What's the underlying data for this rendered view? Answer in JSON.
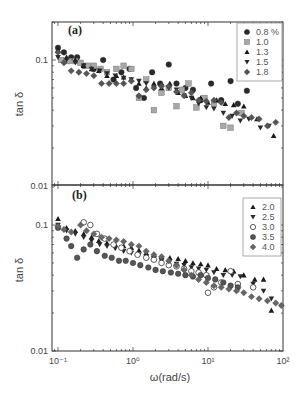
{
  "chart_data": [
    {
      "type": "scatter",
      "panel": "(a)",
      "xscale": "log",
      "yscale": "log",
      "xlabel": "",
      "ylabel": "tan δ",
      "xlim": [
        0.083,
        100
      ],
      "ylim": [
        0.01,
        0.2
      ],
      "yticks": [
        "0.1",
        "0.01"
      ],
      "legend_position": "upper right",
      "series": [
        {
          "name": "0.8 %",
          "marker": "circle",
          "color": "#2a2a2a",
          "x": [
            0.1,
            0.12,
            0.15,
            0.18,
            0.22,
            0.3,
            0.4,
            0.55,
            0.7,
            0.9,
            1.1,
            1.4,
            1.8,
            2.3,
            3,
            3.8,
            5,
            6.3,
            8,
            11,
            15,
            20,
            25,
            33
          ],
          "y": [
            0.125,
            0.115,
            0.105,
            0.105,
            0.09,
            0.085,
            0.1,
            0.07,
            0.08,
            0.085,
            0.06,
            0.05,
            0.08,
            0.065,
            0.092,
            0.065,
            0.06,
            0.058,
            0.048,
            0.065,
            0.048,
            0.068,
            0.045,
            0.057
          ]
        },
        {
          "name": "1.0",
          "marker": "square",
          "color": "#a8a8a8",
          "x": [
            0.11,
            0.14,
            0.17,
            0.2,
            0.25,
            0.3,
            0.37,
            0.45,
            0.6,
            0.75,
            0.95,
            1.2,
            1.5,
            1.9,
            2.4,
            3,
            3.8,
            4.5,
            5.5,
            7,
            9,
            12,
            16,
            20,
            28
          ],
          "y": [
            0.1,
            0.098,
            0.098,
            0.095,
            0.09,
            0.09,
            0.085,
            0.08,
            0.085,
            0.09,
            0.085,
            0.05,
            0.07,
            0.04,
            0.055,
            0.06,
            0.043,
            0.058,
            0.065,
            0.042,
            0.05,
            0.045,
            0.03,
            0.029,
            0.038
          ]
        },
        {
          "name": "1.3",
          "marker": "triangle-up",
          "color": "#1a1a1a",
          "x": [
            0.1,
            0.13,
            0.17,
            0.22,
            0.28,
            0.35,
            0.45,
            0.6,
            0.75,
            0.95,
            1.2,
            1.5,
            1.9,
            2.4,
            3.1,
            4,
            5,
            6.3,
            8,
            10,
            13,
            17,
            22,
            30,
            45,
            75
          ],
          "y": [
            0.12,
            0.105,
            0.1,
            0.09,
            0.085,
            0.082,
            0.075,
            0.075,
            0.073,
            0.07,
            0.065,
            0.06,
            0.065,
            0.06,
            0.065,
            0.055,
            0.052,
            0.05,
            0.05,
            0.046,
            0.048,
            0.045,
            0.044,
            0.043,
            0.034,
            0.025
          ]
        },
        {
          "name": "1.5",
          "marker": "triangle-down",
          "color": "#2a2a2a",
          "x": [
            0.1,
            0.13,
            0.17,
            0.22,
            0.28,
            0.36,
            0.45,
            0.58,
            0.75,
            0.95,
            1.2,
            1.5,
            1.9,
            2.4,
            3,
            3.8,
            4.8,
            6,
            7.5,
            9.5,
            12,
            16,
            21,
            27,
            35,
            50,
            65
          ],
          "y": [
            0.105,
            0.1,
            0.095,
            0.09,
            0.085,
            0.082,
            0.078,
            0.075,
            0.072,
            0.07,
            0.068,
            0.065,
            0.06,
            0.062,
            0.06,
            0.058,
            0.052,
            0.05,
            0.045,
            0.042,
            0.041,
            0.038,
            0.036,
            0.033,
            0.034,
            0.029,
            0.03
          ]
        },
        {
          "name": "1.8",
          "marker": "diamond",
          "color": "#555555",
          "x": [
            0.1,
            0.12,
            0.15,
            0.19,
            0.24,
            0.3,
            0.38,
            0.48,
            0.6,
            0.75,
            0.95,
            1.2,
            1.5,
            1.9,
            2.4,
            3,
            3.8,
            4.8,
            6,
            7.5,
            9.5,
            12,
            15,
            19,
            24,
            30,
            38,
            48,
            62,
            80
          ],
          "y": [
            0.115,
            0.095,
            0.082,
            0.08,
            0.078,
            0.075,
            0.065,
            0.065,
            0.065,
            0.065,
            0.068,
            0.052,
            0.058,
            0.06,
            0.062,
            0.062,
            0.056,
            0.052,
            0.055,
            0.048,
            0.047,
            0.048,
            0.046,
            0.035,
            0.038,
            0.036,
            0.035,
            0.034,
            0.03,
            0.032
          ]
        }
      ]
    },
    {
      "type": "scatter",
      "panel": "(b)",
      "xscale": "log",
      "yscale": "log",
      "xlabel": "ω(rad/s)",
      "ylabel": "tan δ",
      "xlim": [
        0.083,
        100
      ],
      "ylim": [
        0.01,
        0.2
      ],
      "xticks": [
        "10⁻¹",
        "10⁰",
        "10¹",
        "10²"
      ],
      "yticks": [
        "0.1",
        "0.01"
      ],
      "legend_position": "upper right",
      "series": [
        {
          "name": "2.0",
          "marker": "triangle-up",
          "color": "#1a1a1a",
          "x": [
            0.1,
            0.13,
            0.17,
            0.22,
            0.28,
            0.35,
            0.45,
            0.58,
            0.75,
            0.95,
            1.2,
            1.5,
            1.9,
            2.4,
            3.1,
            4,
            5,
            6.3,
            8,
            10,
            13,
            17,
            22,
            30,
            42,
            55,
            70
          ],
          "y": [
            0.112,
            0.095,
            0.09,
            0.085,
            0.08,
            0.075,
            0.072,
            0.07,
            0.068,
            0.066,
            0.063,
            0.06,
            0.058,
            0.056,
            0.055,
            0.054,
            0.052,
            0.05,
            0.049,
            0.048,
            0.045,
            0.044,
            0.043,
            0.04,
            0.037,
            0.037,
            0.021
          ]
        },
        {
          "name": "2.5",
          "marker": "triangle-down",
          "color": "#2a2a2a",
          "x": [
            0.1,
            0.13,
            0.17,
            0.22,
            0.28,
            0.36,
            0.45,
            0.58,
            0.75,
            0.95,
            1.2,
            1.5,
            1.9,
            2.4,
            3,
            3.8,
            4.8,
            6,
            7.5,
            9.5,
            12,
            16,
            21,
            27,
            40,
            55,
            70
          ],
          "y": [
            0.1,
            0.09,
            0.085,
            0.08,
            0.075,
            0.07,
            0.068,
            0.065,
            0.062,
            0.06,
            0.058,
            0.056,
            0.054,
            0.052,
            0.05,
            0.049,
            0.048,
            0.046,
            0.045,
            0.044,
            0.042,
            0.04,
            0.04,
            0.039,
            0.034,
            0.03,
            0.026
          ]
        },
        {
          "name": "3.0",
          "marker": "circle-open",
          "color": "#333333",
          "x": [
            0.22,
            0.27,
            0.33,
            0.42,
            0.55,
            0.7,
            0.9,
            1.15,
            1.5,
            1.9,
            2.4,
            3,
            3.8,
            4.8,
            6,
            7.5,
            9.5,
            10,
            12,
            15,
            20,
            25,
            40
          ],
          "y": [
            0.105,
            0.1,
            0.085,
            0.078,
            0.07,
            0.066,
            0.062,
            0.058,
            0.055,
            0.053,
            0.05,
            0.048,
            0.047,
            0.045,
            0.043,
            0.042,
            0.04,
            0.029,
            0.032,
            0.035,
            0.043,
            0.034,
            0.032
          ]
        },
        {
          "name": "3.5",
          "marker": "circle",
          "color": "#555555",
          "x": [
            0.1,
            0.13,
            0.15,
            0.18,
            0.22,
            0.27,
            0.33,
            0.42,
            0.52,
            0.65,
            0.8,
            1,
            1.25,
            1.6,
            2,
            2.5,
            3.2,
            4,
            5,
            6.3,
            8,
            10,
            12.5,
            16,
            20,
            25
          ],
          "y": [
            0.095,
            0.078,
            0.068,
            0.055,
            0.064,
            0.07,
            0.062,
            0.057,
            0.055,
            0.052,
            0.052,
            0.05,
            0.048,
            0.046,
            0.044,
            0.043,
            0.042,
            0.041,
            0.04,
            0.039,
            0.04,
            0.038,
            0.037,
            0.035,
            0.033,
            0.032
          ]
        },
        {
          "name": "4.0",
          "marker": "diamond",
          "color": "#666666",
          "x": [
            0.1,
            0.12,
            0.15,
            0.2,
            0.24,
            0.3,
            0.38,
            0.48,
            0.6,
            0.75,
            0.95,
            1.2,
            1.5,
            1.9,
            2.4,
            3,
            3.8,
            4.8,
            6,
            7.5,
            9.5,
            12,
            15,
            19,
            24,
            30,
            38,
            48,
            62,
            80,
            95
          ],
          "y": [
            0.098,
            0.092,
            0.088,
            0.1,
            0.09,
            0.085,
            0.08,
            0.078,
            0.076,
            0.074,
            0.07,
            0.068,
            0.062,
            0.058,
            0.056,
            0.052,
            0.048,
            0.044,
            0.04,
            0.037,
            0.035,
            0.033,
            0.032,
            0.031,
            0.03,
            0.029,
            0.027,
            0.026,
            0.025,
            0.024,
            0.023
          ]
        }
      ]
    }
  ],
  "labels": {
    "panel_a": "(a)",
    "panel_b": "(b)",
    "ylabel": "tan δ",
    "xlabel": "ω(rad/s)",
    "ytick_top": "0.1",
    "ytick_bottom": "0.01"
  },
  "colors": {
    "axis": "#333333",
    "background": "#ffffff",
    "legend_border": "#888888"
  }
}
